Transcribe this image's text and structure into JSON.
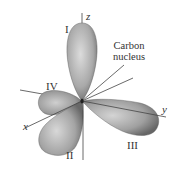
{
  "figure": {
    "axes": {
      "x": "x",
      "y": "y",
      "z": "z"
    },
    "lobes": [
      {
        "id": "I",
        "label": "I"
      },
      {
        "id": "II",
        "label": "II"
      },
      {
        "id": "III",
        "label": "III"
      },
      {
        "id": "IV",
        "label": "IV"
      }
    ],
    "nucleus": {
      "symbol": "C",
      "annotation_line1": "Carbon",
      "annotation_line2": "nucleus"
    },
    "colors": {
      "lobe_fill_light": "#d6d6d6",
      "lobe_fill_dark": "#6e6e6e",
      "axis_line": "#444444",
      "text": "#333333"
    }
  }
}
